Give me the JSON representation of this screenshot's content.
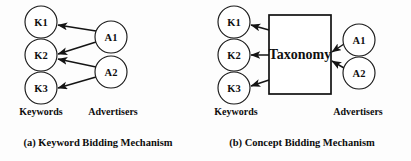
{
  "figure": {
    "background_color": "#fdfdfd",
    "ink_color": "#111111"
  },
  "panels": [
    {
      "id": "panel-a",
      "caption": "(a) Keyword Bidding Mechanism",
      "group_labels": {
        "left": "Keywords",
        "right": "Advertisers"
      },
      "keyword_nodes": [
        {
          "label": "K1",
          "cx": 41,
          "cy": 22,
          "r": 16
        },
        {
          "label": "K2",
          "cx": 41,
          "cy": 55,
          "r": 16
        },
        {
          "label": "K3",
          "cx": 41,
          "cy": 88,
          "r": 16
        }
      ],
      "advertiser_nodes": [
        {
          "label": "A1",
          "cx": 111,
          "cy": 37,
          "r": 16
        },
        {
          "label": "A2",
          "cx": 111,
          "cy": 72,
          "r": 16
        }
      ],
      "edges": [
        {
          "from": "A1",
          "to": "K1",
          "x1": 96,
          "y1": 31,
          "x2": 58,
          "y2": 25
        },
        {
          "from": "A1",
          "to": "K2",
          "x1": 96,
          "y1": 42,
          "x2": 58,
          "y2": 54
        },
        {
          "from": "A2",
          "to": "K2",
          "x1": 96,
          "y1": 67,
          "x2": 58,
          "y2": 59
        },
        {
          "from": "A2",
          "to": "K3",
          "x1": 96,
          "y1": 77,
          "x2": 58,
          "y2": 88
        }
      ]
    },
    {
      "id": "panel-b",
      "caption": "(b) Concept Bidding Mechanism",
      "group_labels": {
        "left": "Keywords",
        "right": "Advertisers"
      },
      "keyword_nodes": [
        {
          "label": "K1",
          "cx": 234,
          "cy": 22,
          "r": 16
        },
        {
          "label": "K2",
          "cx": 234,
          "cy": 55,
          "r": 16
        },
        {
          "label": "K3",
          "cx": 234,
          "cy": 88,
          "r": 16
        }
      ],
      "advertiser_nodes": [
        {
          "label": "A1",
          "cx": 359,
          "cy": 40,
          "r": 16
        },
        {
          "label": "A2",
          "cx": 359,
          "cy": 73,
          "r": 16
        }
      ],
      "concept_box": {
        "label": "Taxonomy",
        "x": 269,
        "y": 15,
        "width": 62,
        "height": 79
      },
      "edges": [
        {
          "from": "Taxonomy",
          "to": "K1",
          "x1": 269,
          "y1": 30,
          "x2": 251,
          "y2": 25
        },
        {
          "from": "Taxonomy",
          "to": "K2",
          "x1": 269,
          "y1": 55,
          "x2": 251,
          "y2": 55
        },
        {
          "from": "Taxonomy",
          "to": "K3",
          "x1": 269,
          "y1": 80,
          "x2": 251,
          "y2": 86
        },
        {
          "from": "A1",
          "to": "Taxonomy",
          "x1": 344,
          "y1": 44,
          "x2": 332,
          "y2": 52
        },
        {
          "from": "A2",
          "to": "Taxonomy",
          "x1": 344,
          "y1": 68,
          "x2": 332,
          "y2": 61
        }
      ]
    }
  ],
  "layout": {
    "group_label_baseline_y": 115,
    "caption_baseline_y": 146,
    "panel_a_left_group_x": 41,
    "panel_a_right_group_x": 113,
    "panel_a_caption_x": 98,
    "panel_b_left_group_x": 236,
    "panel_b_right_group_x": 358,
    "panel_b_caption_x": 302
  }
}
